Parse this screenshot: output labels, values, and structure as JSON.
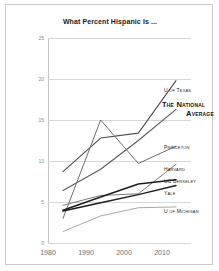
{
  "chart_data": {
    "type": "line",
    "title": "What Percent Hispanic Is ...",
    "xlabel": "",
    "ylabel": "",
    "x": [
      1980,
      1990,
      2000,
      2010
    ],
    "xticklabels": [
      "1980",
      "1990",
      "2000",
      "2010"
    ],
    "ylim": [
      0,
      25
    ],
    "yticks": [
      0,
      5,
      10,
      15,
      20,
      25
    ],
    "yticklabels": [
      "0",
      "5",
      "10",
      "15",
      "20",
      "25"
    ],
    "grid": true,
    "legend_position": "right-inline-labels",
    "series": [
      {
        "name": "U of Texas",
        "values": [
          8.7,
          12.8,
          13.4,
          19.8
        ],
        "color": "#4d4d4d",
        "width": 1.1
      },
      {
        "name": "The National Average",
        "values": [
          6.4,
          9.0,
          12.5,
          16.3
        ],
        "color": "#5a5a5a",
        "width": 1.1
      },
      {
        "name": "Princeton",
        "values": [
          3.0,
          15.0,
          9.7,
          11.8
        ],
        "color": "#6e6e6e",
        "width": 1.0
      },
      {
        "name": "Harvard",
        "values": [
          4.6,
          5.8,
          6.0,
          9.6
        ],
        "color": "#7a7a7a",
        "width": 1.0
      },
      {
        "name": "UC Berkeley",
        "values": [
          4.0,
          5.6,
          7.2,
          7.7
        ],
        "color": "#1c1c1c",
        "width": 1.5
      },
      {
        "name": "Yale",
        "values": [
          3.9,
          4.9,
          5.9,
          7.0
        ],
        "color": "#1c1c1c",
        "width": 1.5
      },
      {
        "name": "U of Michigan",
        "values": [
          1.4,
          3.3,
          4.3,
          4.4
        ],
        "color": "#a8a8a8",
        "width": 1.0
      }
    ]
  },
  "labels": {
    "u_of_texas": "U of Texas",
    "national_average_line1": "The National",
    "national_average_line2": "Average",
    "princeton": "Princeton",
    "harvard": "Harvard",
    "uc_berkeley": "UC Berkeley",
    "yale": "Yale",
    "u_of_michigan": "U of Michigan"
  }
}
